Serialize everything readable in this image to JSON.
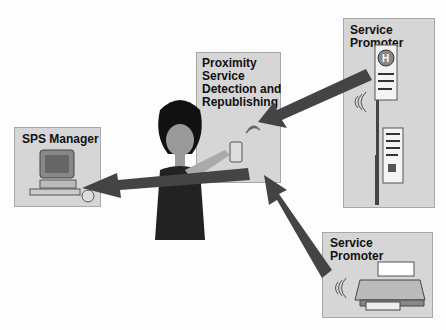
{
  "diagram": {
    "nodes": [
      {
        "id": "sps-manager",
        "label": "SPS Manager",
        "icon": "computer-icon"
      },
      {
        "id": "proximity",
        "label_lines": [
          "Proximity",
          "Service",
          "Detection and",
          "Republishing"
        ],
        "icon": "wireless-signal-icon"
      },
      {
        "id": "promoter-sign",
        "label_lines": [
          "Service",
          "Promoter"
        ],
        "icon": "hospital-sign-icon"
      },
      {
        "id": "promoter-printer",
        "label_lines": [
          "Service",
          "Promoter"
        ],
        "icon": "printer-icon"
      }
    ],
    "edges": [
      {
        "from": "promoter-sign",
        "to": "proximity"
      },
      {
        "from": "promoter-printer",
        "to": "proximity"
      },
      {
        "from": "proximity",
        "to": "sps-manager"
      }
    ],
    "person": "woman-with-phone"
  }
}
